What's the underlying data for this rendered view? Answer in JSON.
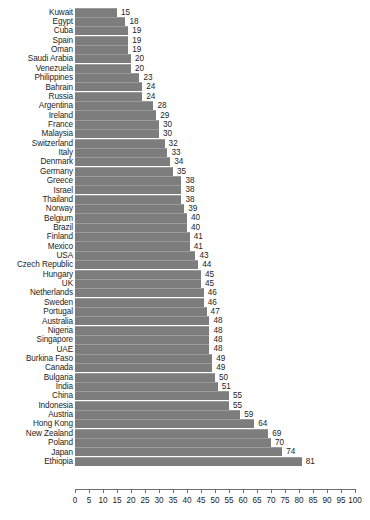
{
  "chart_data": {
    "type": "bar",
    "orientation": "horizontal",
    "title": "",
    "subtitle": "",
    "xlabel": "",
    "ylabel": "",
    "xlim": [
      0,
      100
    ],
    "xticks": [
      0,
      5,
      10,
      15,
      20,
      25,
      30,
      35,
      40,
      45,
      50,
      55,
      60,
      65,
      70,
      75,
      80,
      85,
      90,
      95,
      100
    ],
    "grid": false,
    "legend": null,
    "bar_color": "#7d7d7d",
    "text_color": "#1d1d1d",
    "axis_color": "#6f6f6f",
    "data_labels": true,
    "sort": "ascending",
    "categories": [
      "Kuwait",
      "Egypt",
      "Cuba",
      "Spain",
      "Oman",
      "Saudi Arabia",
      "Venezuela",
      "Philippines",
      "Bahrain",
      "Russia",
      "Argentina",
      "Ireland",
      "France",
      "Malaysia",
      "Switzerland",
      "Italy",
      "Denmark",
      "Germany",
      "Greece",
      "Israel",
      "Thailand",
      "Norway",
      "Belgium",
      "Brazil",
      "Finland",
      "Mexico",
      "USA",
      "Czech Republic",
      "Hungary",
      "UK",
      "Netherlands",
      "Sweden",
      "Portugal",
      "Australia",
      "Nigeria",
      "Singapore",
      "UAE",
      "Burkina Faso",
      "Canada",
      "Bulgaria",
      "India",
      "China",
      "Indonesia",
      "Austria",
      "Hong Kong",
      "New Zealand",
      "Poland",
      "Japan",
      "Ethiopia"
    ],
    "values": [
      15,
      18,
      19,
      19,
      19,
      20,
      20,
      23,
      24,
      24,
      28,
      29,
      30,
      30,
      32,
      33,
      34,
      35,
      38,
      38,
      38,
      39,
      40,
      40,
      41,
      41,
      43,
      44,
      45,
      45,
      46,
      46,
      47,
      48,
      48,
      48,
      48,
      49,
      49,
      50,
      51,
      55,
      55,
      59,
      64,
      69,
      70,
      74,
      81
    ]
  }
}
